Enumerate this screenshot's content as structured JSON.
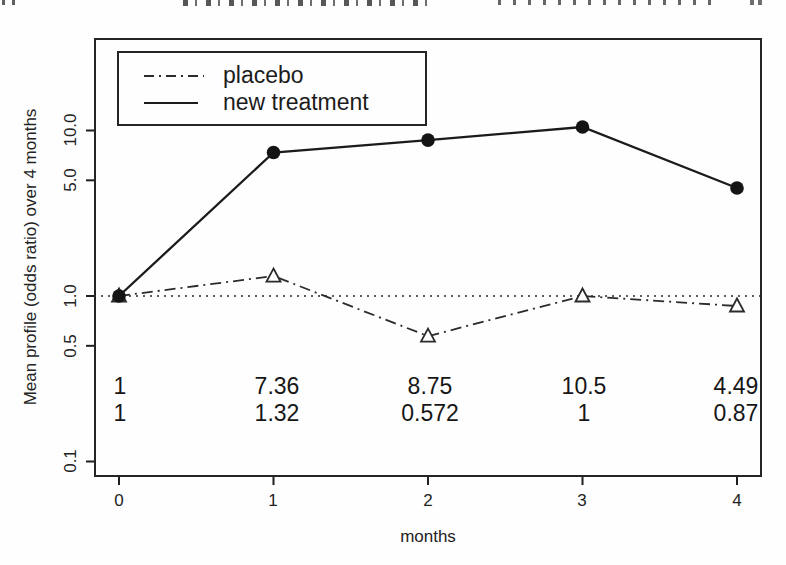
{
  "chart_data": {
    "type": "line",
    "title": "",
    "xlabel": "months",
    "ylabel": "Mean profile (odds ratio) over 4 months",
    "y_scale": "log",
    "ylim": [
      0.08,
      20
    ],
    "x": [
      0,
      1,
      2,
      3,
      4
    ],
    "xticks": [
      "0",
      "1",
      "2",
      "3",
      "4"
    ],
    "yticks": [
      "10.0",
      "5.0",
      "1.0",
      "0.5",
      "0.1"
    ],
    "grid": false,
    "reference_line_y": 1.0,
    "legend_position": "top-left",
    "series": [
      {
        "name": "new treatment",
        "values": [
          1,
          7.36,
          8.75,
          10.5,
          4.49
        ],
        "line": "solid",
        "marker": "filled-circle",
        "color": "#1b1b1b"
      },
      {
        "name": "placebo",
        "values": [
          1,
          1.32,
          0.572,
          1,
          0.87
        ],
        "line": "dash-dot",
        "marker": "open-triangle",
        "color": "#2b2b2b"
      }
    ],
    "value_labels": {
      "row1": [
        "1",
        "7.36",
        "8.75",
        "10.5",
        "4.49"
      ],
      "row2": [
        "1",
        "1.32",
        "0.572",
        "1",
        "0.87"
      ]
    }
  },
  "legend": {
    "items": [
      {
        "label": "placebo",
        "line_style": "dash-dot"
      },
      {
        "label": "new treatment",
        "line_style": "solid"
      }
    ]
  },
  "colors": {
    "ink": "#1f1f1f",
    "background": "#fefefe",
    "reference_line": "#2a2a2a"
  }
}
